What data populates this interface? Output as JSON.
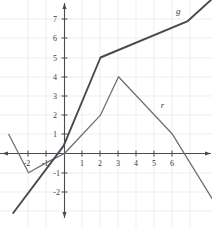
{
  "chart_data": {
    "type": "line",
    "title": "",
    "subtitle": "",
    "xlabel": "",
    "ylabel": "",
    "xlim": [
      -3.6,
      8.2
    ],
    "ylim": [
      -2.9,
      8.2
    ],
    "grid": true,
    "legend_position": "inline-curve-labels",
    "x_ticks": [
      -2,
      -1,
      1,
      2,
      3,
      4,
      5,
      6
    ],
    "x_tick_labels": [
      "-2",
      "-1",
      "1",
      "2",
      "3",
      "4",
      "5",
      "6"
    ],
    "y_ticks": [
      -2,
      -1,
      1,
      2,
      3,
      4,
      5,
      6,
      7
    ],
    "y_tick_labels": [
      "-2",
      "-1",
      "1",
      "2",
      "3",
      "4",
      "5",
      "6",
      "7"
    ],
    "series": [
      {
        "name": "g",
        "label": "g",
        "color": "#48484f",
        "width": 1.9,
        "label_at": {
          "x": 6.2,
          "y": 7.25
        },
        "points": [
          {
            "x": -2.85,
            "y": -3.1
          },
          {
            "x": -0.05,
            "y": 0.4
          },
          {
            "x": 2.0,
            "y": 5.0
          },
          {
            "x": 6.85,
            "y": 6.9
          },
          {
            "x": 8.2,
            "y": 8.05
          }
        ]
      },
      {
        "name": "r",
        "label": "r",
        "color": "#6d6d75",
        "width": 1.25,
        "label_at": {
          "x": 5.35,
          "y": 2.35
        },
        "points": [
          {
            "x": -3.1,
            "y": 1.0
          },
          {
            "x": -2.0,
            "y": -1.0
          },
          {
            "x": -0.95,
            "y": -0.45
          },
          {
            "x": 0.0,
            "y": 0.0
          },
          {
            "x": 1.0,
            "y": 1.0
          },
          {
            "x": 2.0,
            "y": 2.0
          },
          {
            "x": 3.0,
            "y": 4.0
          },
          {
            "x": 6.0,
            "y": 1.0
          },
          {
            "x": 8.2,
            "y": -2.35
          }
        ]
      }
    ]
  },
  "labels": {
    "y7": "7",
    "y6": "6",
    "y5": "5",
    "y4": "4",
    "y3": "3",
    "y2": "2",
    "y1": "1",
    "ym1": "-1",
    "ym2": "-2",
    "xm2": "-2",
    "xm1": "-1",
    "x1": "1",
    "x2": "2",
    "x3": "3",
    "x4": "4",
    "x5": "5",
    "x6": "6",
    "curve_g": "g",
    "curve_r": "r"
  },
  "colors": {
    "background": "#ffffff",
    "axis": "#4a4a52",
    "grid": "#e9e7ea",
    "series_g": "#48484f",
    "series_r": "#6d6d75",
    "text": "#3a3a3a"
  }
}
